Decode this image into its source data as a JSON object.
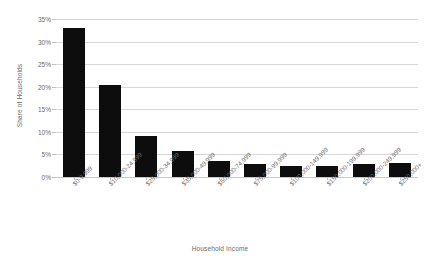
{
  "chart_data": {
    "type": "bar",
    "title": "",
    "xlabel": "Household Income",
    "ylabel": "Share of Households",
    "ylim": [
      0,
      35
    ],
    "ytick_labels": [
      "0%",
      "5%",
      "10%",
      "15%",
      "20%",
      "25%",
      "30%",
      "35%"
    ],
    "ytick_values": [
      0,
      5,
      10,
      15,
      20,
      25,
      30,
      35
    ],
    "grid": true,
    "legend": "none",
    "bar_color": "#0d0d0d",
    "grid_color": "#d7d7d7",
    "categories": [
      "$0-9,999",
      "$10,000-24,999",
      "$25,000-34,999",
      "$35,000-49,999",
      "$50,000-74,999",
      "$75,000-99,999",
      "$100,000-149,999",
      "$150,000-199,999",
      "$200,000-249,999",
      "$250,000+"
    ],
    "values": [
      33.0,
      20.4,
      9.0,
      5.8,
      3.5,
      2.9,
      2.5,
      2.5,
      2.8,
      3.0
    ]
  }
}
